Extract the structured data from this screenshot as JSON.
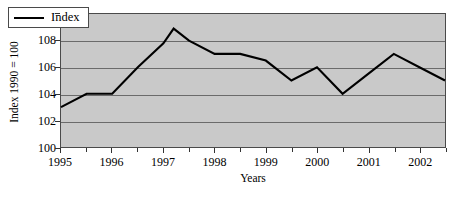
{
  "chart_data": {
    "type": "line",
    "title": "",
    "xlabel": "Years",
    "ylabel": "Index 1990 = 100",
    "ylim": [
      100,
      110
    ],
    "xlim": [
      1995.0,
      2002.5
    ],
    "grid": true,
    "legend_position": "top-left",
    "y_ticks": [
      110,
      108,
      106,
      104,
      102,
      100
    ],
    "y_tick_labels": [
      "110",
      "108",
      "106",
      "104",
      "102",
      "100"
    ],
    "x_ticks": [
      1995,
      1996,
      1997,
      1998,
      1999,
      2000,
      2001,
      2002
    ],
    "x_tick_labels": [
      "1995",
      "1996",
      "1997",
      "1998",
      "1999",
      "2000",
      "2001",
      "2002"
    ],
    "x_minor_ticks": [
      1995.5,
      1996.5,
      1997.5,
      1998.5,
      1999.5,
      2000.5,
      2001.5,
      2002.5
    ],
    "series": [
      {
        "name": "Index",
        "color": "#000000",
        "x": [
          1995.0,
          1995.5,
          1996.0,
          1996.5,
          1997.0,
          1997.2,
          1997.5,
          1998.0,
          1998.5,
          1999.0,
          1999.5,
          2000.0,
          2000.5,
          2001.0,
          2001.5,
          2002.0,
          2002.5
        ],
        "values": [
          103.0,
          104.0,
          104.0,
          106.0,
          107.8,
          108.9,
          108.0,
          107.0,
          107.0,
          106.5,
          105.0,
          106.0,
          104.0,
          105.5,
          107.0,
          106.0,
          105.0
        ]
      }
    ],
    "legend_entries": [
      "Index"
    ],
    "plot_background": "#c9c9c9",
    "gridline_color": "#6b6b6b",
    "axis_color": "#4a4a4a"
  }
}
